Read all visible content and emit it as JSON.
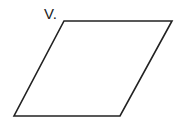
{
  "diagram": {
    "shape": "parallelogram",
    "vertex_label": "V.",
    "vertices": {
      "top_left": [
        64,
        21
      ],
      "top_right": [
        172,
        21
      ],
      "bottom_right": [
        120,
        116
      ],
      "bottom_left": [
        14,
        116
      ]
    },
    "stroke_color": "#222222",
    "fill_color": "#ffffff"
  }
}
